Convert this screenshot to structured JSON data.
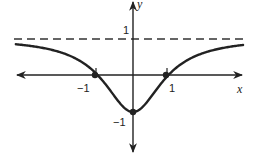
{
  "chart_data": {
    "type": "line",
    "title": "",
    "xlabel": "x",
    "ylabel": "y",
    "function_hint": "f(x) = (x^2 - 1) / (x^2 + 1)",
    "xlim": [
      -3.3,
      3.1
    ],
    "ylim": [
      -2.2,
      2.1
    ],
    "grid": false,
    "legend": null,
    "x_tick_labels": [
      {
        "value": -1,
        "label": "−1"
      },
      {
        "value": 1,
        "label": "1"
      }
    ],
    "y_tick_labels": [
      {
        "value": 1,
        "label": "1"
      },
      {
        "value": -1,
        "label": "−1"
      }
    ],
    "asymptote": {
      "type": "horizontal",
      "y": 1,
      "style": "dashed"
    },
    "marked_points": [
      {
        "x": -1,
        "y": 0
      },
      {
        "x": 1,
        "y": 0
      },
      {
        "x": 0,
        "y": -1
      }
    ],
    "series": [
      {
        "name": "f(x)",
        "x": [
          -3.3,
          -3,
          -2.5,
          -2,
          -1.5,
          -1,
          -0.75,
          -0.5,
          -0.25,
          0,
          0.25,
          0.5,
          0.75,
          1,
          1.5,
          2,
          2.5,
          3,
          3.1
        ],
        "y": [
          0.832,
          0.8,
          0.724,
          0.6,
          0.385,
          0,
          -0.28,
          -0.6,
          -0.882,
          -1,
          -0.882,
          -0.6,
          -0.28,
          0,
          0.385,
          0.6,
          0.724,
          0.8,
          0.811
        ]
      }
    ]
  },
  "labels": {
    "x_axis": "x",
    "y_axis": "y",
    "y_one": "1",
    "y_neg_one": "−1",
    "x_neg_one": "−1",
    "x_one": "1"
  }
}
